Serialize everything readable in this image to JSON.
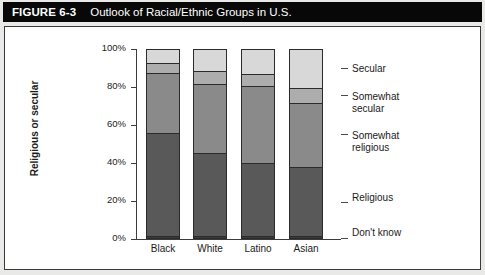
{
  "figure": {
    "label": "FIGURE 6-3",
    "title": "Outlook of Racial/Ethnic Groups in U.S."
  },
  "chart_data": {
    "type": "bar",
    "stacked": true,
    "title": "Outlook of Racial/Ethnic Groups in U.S.",
    "xlabel": "",
    "ylabel": "Religious or secular",
    "ylim": [
      0,
      100
    ],
    "ytick_labels": [
      "0%",
      "20%",
      "40%",
      "60%",
      "80%",
      "100%"
    ],
    "ytick_values": [
      0,
      20,
      40,
      60,
      80,
      100
    ],
    "grid": false,
    "legend_position": "right",
    "categories": [
      "Black",
      "White",
      "Latino",
      "Asian"
    ],
    "series": [
      {
        "name": "Don't know",
        "values": [
          1,
          1,
          1,
          1
        ],
        "color": "#3a3a3a"
      },
      {
        "name": "Religious",
        "values": [
          55,
          44,
          39,
          37
        ],
        "color": "#595959"
      },
      {
        "name": "Somewhat religious",
        "values": [
          32,
          37,
          41,
          34
        ],
        "color": "#8a8a8a"
      },
      {
        "name": "Somewhat secular",
        "values": [
          5,
          7,
          6,
          8
        ],
        "color": "#adadad"
      },
      {
        "name": "Secular",
        "values": [
          7,
          11,
          13,
          20
        ],
        "color": "#d8d8d8"
      }
    ],
    "legend": [
      {
        "label": "Secular"
      },
      {
        "label": "Somewhat\nsecular"
      },
      {
        "label": "Somewhat\nreligious"
      },
      {
        "label": "Religious"
      },
      {
        "label": "Don't know"
      }
    ]
  }
}
